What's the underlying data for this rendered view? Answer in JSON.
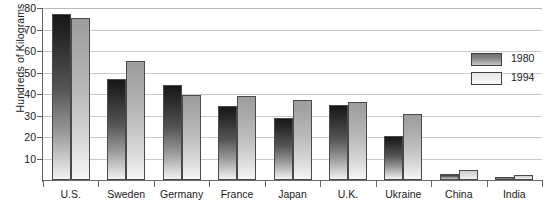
{
  "chart_data": {
    "type": "bar",
    "title": "",
    "subtitle": "",
    "xlabel": "",
    "ylabel": "Hundreds of Kilograms",
    "categories": [
      "U.S.",
      "Sweden",
      "Germany",
      "France",
      "Japan",
      "U.K.",
      "Ukraine",
      "China",
      "India"
    ],
    "series": [
      {
        "name": "1980",
        "color": "#555555",
        "values": [
          77,
          47,
          44,
          34.5,
          29,
          35,
          20.5,
          3,
          1.5
        ]
      },
      {
        "name": "1994",
        "color": "#c8c8c8",
        "values": [
          75.5,
          55.5,
          39.5,
          39,
          37,
          36.5,
          30.5,
          4.5,
          2.5
        ]
      }
    ],
    "ylim": [
      0,
      80
    ],
    "yticks": [
      10,
      20,
      30,
      40,
      50,
      60,
      70,
      80
    ],
    "ytick_labels": [
      "10",
      "20",
      "30",
      "40",
      "50",
      "60",
      "70",
      "80"
    ],
    "grid": "horizontal",
    "legend_position": "right-upper"
  },
  "legend": {
    "entries": [
      {
        "label": "1980",
        "swatch": "dark-gradient-swatch"
      },
      {
        "label": "1994",
        "swatch": "light-gradient-swatch"
      }
    ]
  }
}
